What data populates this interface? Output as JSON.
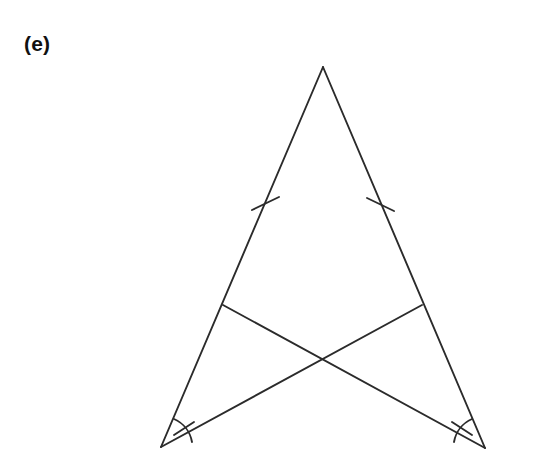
{
  "figure": {
    "label": "(e)",
    "caption_position": "top-left"
  },
  "canvas": {
    "width": 560,
    "height": 471,
    "background_color": "#ffffff"
  },
  "style": {
    "line_color": "#2b2b2b",
    "line_width": 1.9,
    "label_color": "#111111"
  },
  "diagram": {
    "type": "geometry-triangle-with-cevians",
    "points": {
      "apex": {
        "name": "A",
        "x": 323,
        "y": 67
      },
      "base_left": {
        "name": "B",
        "x": 161,
        "y": 447
      },
      "base_right": {
        "name": "C",
        "x": 485,
        "y": 448
      },
      "cevian_foot_left_leg": {
        "name": "D",
        "x": 223,
        "y": 305
      },
      "cevian_foot_right_leg": {
        "name": "E",
        "x": 422,
        "y": 305
      },
      "cevian_intersection": {
        "name": "P",
        "x": 323,
        "y": 360
      }
    },
    "segments": [
      {
        "name": "left-leg",
        "from": "apex",
        "to": "base_left",
        "x1": 323,
        "y1": 67,
        "x2": 161,
        "y2": 447
      },
      {
        "name": "right-leg",
        "from": "apex",
        "to": "base_right",
        "x1": 323,
        "y1": 67,
        "x2": 485,
        "y2": 448
      },
      {
        "name": "cevian-from-base-left",
        "from": "base_left",
        "to": "cevian_foot_right_leg",
        "x1": 161,
        "y1": 447,
        "x2": 422,
        "y2": 305
      },
      {
        "name": "cevian-from-base-right",
        "from": "base_right",
        "to": "cevian_foot_left_leg",
        "x1": 485,
        "y1": 448,
        "x2": 223,
        "y2": 305
      }
    ],
    "tick_marks": [
      {
        "name": "tick-left-leg",
        "count": 1,
        "x1": 252,
        "y1": 210,
        "x2": 279,
        "y2": 197
      },
      {
        "name": "tick-right-leg",
        "count": 1,
        "x1": 367,
        "y1": 198,
        "x2": 394,
        "y2": 211
      }
    ],
    "angle_marks": [
      {
        "name": "angle-arc-base-left",
        "vertex": "base_left",
        "count": 1,
        "radius": 31,
        "path": "M 174 419 A 31 31 0 0 1 192 442",
        "tick": {
          "x1": 174,
          "y1": 435,
          "x2": 194,
          "y2": 422
        }
      },
      {
        "name": "angle-arc-base-right",
        "vertex": "base_right",
        "count": 1,
        "radius": 31,
        "path": "M 454 442 A 31 31 0 0 1 472 419",
        "tick": {
          "x1": 452,
          "y1": 422,
          "x2": 472,
          "y2": 435
        }
      }
    ]
  }
}
